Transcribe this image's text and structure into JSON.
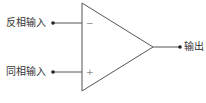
{
  "diagram": {
    "type": "op-amp symbol",
    "inverting_input": {
      "label": "反相输入",
      "sign": "−"
    },
    "non_inverting_input": {
      "label": "同相输入",
      "sign": "+"
    },
    "output": {
      "label": "输出"
    },
    "colors": {
      "stroke": "#555555",
      "text": "#333333",
      "background": "#ffffff"
    }
  }
}
